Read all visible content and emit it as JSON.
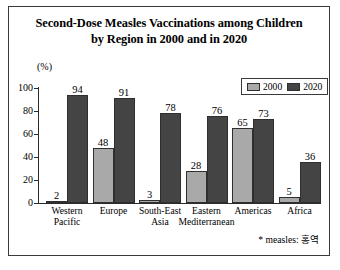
{
  "figure": {
    "title_line1": "Second-Dose Measles Vaccinations among Children",
    "title_line2": "by Region in 2000 and in 2020",
    "unit_label": "(%)",
    "footnote": "* measles: 홍역",
    "colors": {
      "series_2000": "#a9a9a9",
      "series_2020": "#444444",
      "axis": "#2b2b2b",
      "border": "#3a3a3a",
      "background": "#ffffff"
    }
  },
  "legend": {
    "items": [
      {
        "label": "2000",
        "color": "#a9a9a9"
      },
      {
        "label": "2020",
        "color": "#444444"
      }
    ]
  },
  "axis": {
    "y_ticks": [
      "100",
      "80",
      "60",
      "40",
      "20",
      "0"
    ]
  },
  "chart_data": {
    "type": "bar",
    "title": "Second-Dose Measles Vaccinations among Children by Region in 2000 and in 2020",
    "xlabel": "",
    "ylabel": "(%)",
    "ylim": [
      0,
      100
    ],
    "ytick_values": [
      0,
      20,
      40,
      60,
      80,
      100
    ],
    "grid": false,
    "legend_position": "top-right",
    "categories": [
      "Western Pacific",
      "Europe",
      "South-East Asia",
      "Eastern Mediterranean",
      "Americas",
      "Africa"
    ],
    "category_lines": [
      [
        "Western",
        "Pacific"
      ],
      [
        "Europe",
        ""
      ],
      [
        "South-East",
        "Asia"
      ],
      [
        "Eastern",
        "Mediterranean"
      ],
      [
        "Americas",
        ""
      ],
      [
        "Africa",
        ""
      ]
    ],
    "series": [
      {
        "name": "2000",
        "values": [
          2,
          48,
          3,
          28,
          65,
          5
        ]
      },
      {
        "name": "2020",
        "values": [
          94,
          91,
          78,
          76,
          73,
          36
        ]
      }
    ],
    "annotations": [
      "* measles: 홍역"
    ]
  }
}
